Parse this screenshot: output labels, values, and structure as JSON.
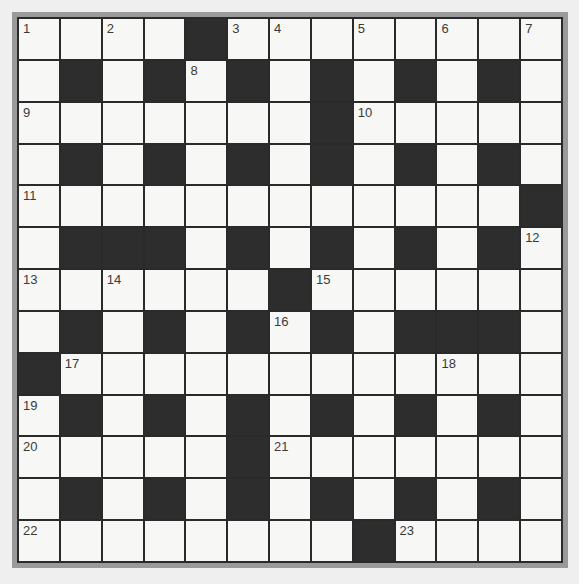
{
  "puzzle": {
    "type": "crossword",
    "rows": 13,
    "cols": 13,
    "layout": [
      "WWWWBWWWWWWWW",
      "WBWBWBWBWBWBW",
      "WWWWWWWBWWWWW",
      "WBWBWBWBWBWBW",
      "WWWWWWWWWWWWB",
      "WBBBWBWBWBWBW",
      "WWWWWWBWWWWWW",
      "WBWBWBWBWBBBW",
      "BWWWWWWWWWWWW",
      "WBWBWBWBWBWBW",
      "WWWWWBWWWWWWW",
      "WBWBWBWBWBWBW",
      "WWWWWWWWBWWWW"
    ],
    "numbers": [
      {
        "row": 0,
        "col": 0,
        "n": "1"
      },
      {
        "row": 0,
        "col": 2,
        "n": "2"
      },
      {
        "row": 0,
        "col": 5,
        "n": "3"
      },
      {
        "row": 0,
        "col": 6,
        "n": "4"
      },
      {
        "row": 0,
        "col": 8,
        "n": "5"
      },
      {
        "row": 0,
        "col": 10,
        "n": "6"
      },
      {
        "row": 0,
        "col": 12,
        "n": "7"
      },
      {
        "row": 1,
        "col": 4,
        "n": "8"
      },
      {
        "row": 2,
        "col": 0,
        "n": "9"
      },
      {
        "row": 2,
        "col": 8,
        "n": "10"
      },
      {
        "row": 4,
        "col": 0,
        "n": "11"
      },
      {
        "row": 5,
        "col": 12,
        "n": "12"
      },
      {
        "row": 6,
        "col": 0,
        "n": "13"
      },
      {
        "row": 6,
        "col": 2,
        "n": "14"
      },
      {
        "row": 6,
        "col": 7,
        "n": "15"
      },
      {
        "row": 7,
        "col": 6,
        "n": "16"
      },
      {
        "row": 8,
        "col": 1,
        "n": "17"
      },
      {
        "row": 8,
        "col": 10,
        "n": "18"
      },
      {
        "row": 9,
        "col": 0,
        "n": "19"
      },
      {
        "row": 10,
        "col": 0,
        "n": "20"
      },
      {
        "row": 10,
        "col": 6,
        "n": "21"
      },
      {
        "row": 12,
        "col": 0,
        "n": "22"
      },
      {
        "row": 12,
        "col": 9,
        "n": "23"
      }
    ],
    "colors": {
      "black_cell": "#2d2d2d",
      "white_cell": "#f7f7f5",
      "grid_line": "#2a2a2a",
      "frame": "#9a9a9a",
      "background": "#efefef"
    }
  }
}
